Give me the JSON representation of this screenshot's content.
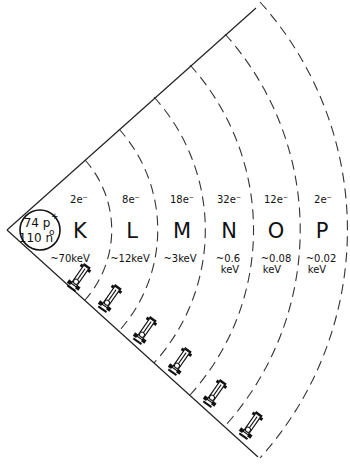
{
  "diagram": {
    "type": "atomic-shell-sector",
    "nucleus": {
      "protons_label": "74 p",
      "protons_sup": "+",
      "neutrons_label": "110 n",
      "neutrons_sup": "o"
    },
    "shells": [
      {
        "name": "K",
        "electrons": "2e⁻",
        "energy_line1": "~70keV",
        "energy_line2": ""
      },
      {
        "name": "L",
        "electrons": "8e⁻",
        "energy_line1": "~12keV",
        "energy_line2": ""
      },
      {
        "name": "M",
        "electrons": "18e⁻",
        "energy_line1": "~3keV",
        "energy_line2": ""
      },
      {
        "name": "N",
        "electrons": "32e⁻",
        "energy_line1": "~0.6",
        "energy_line2": "keV"
      },
      {
        "name": "O",
        "electrons": "12e⁻",
        "energy_line1": "~0.08",
        "energy_line2": "keV"
      },
      {
        "name": "P",
        "electrons": "2e⁻",
        "energy_line1": "~0.02",
        "energy_line2": "keV"
      }
    ],
    "icons": [
      "race-car-icon",
      "race-car-icon",
      "race-car-icon",
      "race-car-icon",
      "race-car-icon",
      "race-car-icon"
    ],
    "colors": {
      "line": "#222222",
      "background": "#ffffff"
    }
  }
}
